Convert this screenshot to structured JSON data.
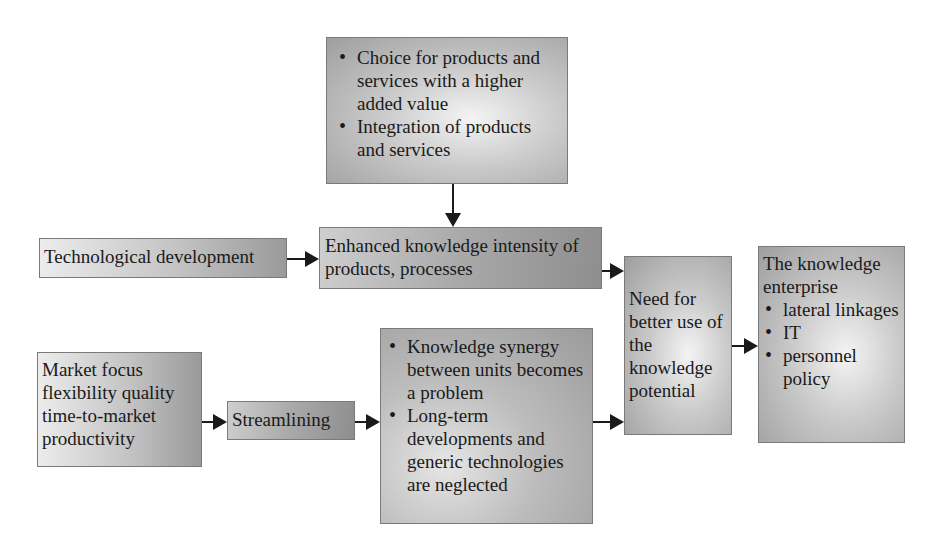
{
  "diagram": {
    "type": "flowchart",
    "nodes": {
      "value_added": {
        "bullets": [
          "Choice for products and services with a higher added value",
          "Integration of products and services"
        ]
      },
      "tech_dev": {
        "label": "Technological development"
      },
      "enhanced": {
        "label": "Enhanced knowledge intensity of products, processes"
      },
      "market": {
        "label": "Market focus flexibility quality time-to-market productivity"
      },
      "streamlining": {
        "label": "Streamlining"
      },
      "synergy": {
        "bullets": [
          "Knowledge synergy between units becomes a problem",
          "Long-term developments and generic technologies are neglected"
        ]
      },
      "need": {
        "label": "Need for better use of the knowledge potential"
      },
      "enterprise": {
        "title": "The knowledge enterprise",
        "bullets": [
          "lateral linkages",
          "IT",
          "personnel policy"
        ]
      }
    },
    "edges": [
      {
        "from": "value_added",
        "to": "enhanced"
      },
      {
        "from": "tech_dev",
        "to": "enhanced"
      },
      {
        "from": "enhanced",
        "to": "need"
      },
      {
        "from": "market",
        "to": "streamlining"
      },
      {
        "from": "streamlining",
        "to": "synergy"
      },
      {
        "from": "synergy",
        "to": "need"
      },
      {
        "from": "need",
        "to": "enterprise"
      }
    ]
  }
}
